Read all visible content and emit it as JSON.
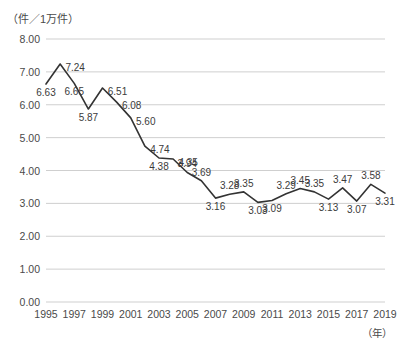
{
  "chart_data": {
    "type": "line",
    "title": "",
    "ylabel": "（件／1万件）",
    "xlabel": "（年）",
    "ylim": [
      0,
      8
    ],
    "yticks": [
      "0.00",
      "1.00",
      "2.00",
      "3.00",
      "4.00",
      "5.00",
      "6.00",
      "7.00",
      "8.00"
    ],
    "ytick_values": [
      0,
      1,
      2,
      3,
      4,
      5,
      6,
      7,
      8
    ],
    "grid": true,
    "legend": "none",
    "x": [
      1995,
      1996,
      1997,
      1998,
      1999,
      2000,
      2001,
      2002,
      2003,
      2004,
      2005,
      2006,
      2007,
      2008,
      2009,
      2010,
      2011,
      2012,
      2013,
      2014,
      2015,
      2016,
      2017,
      2018,
      2019
    ],
    "xtick_labels": [
      "1995",
      "1997",
      "1999",
      "2001",
      "2003",
      "2005",
      "2007",
      "2009",
      "2011",
      "2013",
      "2015",
      "2017",
      "2019"
    ],
    "xtick_values": [
      1995,
      1997,
      1999,
      2001,
      2003,
      2005,
      2007,
      2009,
      2011,
      2013,
      2015,
      2017,
      2019
    ],
    "values": [
      6.63,
      7.24,
      6.65,
      5.87,
      6.51,
      6.08,
      5.6,
      4.74,
      4.38,
      4.35,
      3.94,
      3.69,
      3.16,
      3.28,
      3.35,
      3.03,
      3.09,
      3.29,
      3.45,
      3.35,
      3.13,
      3.47,
      3.07,
      3.58,
      3.31
    ],
    "point_labels": [
      "6.63",
      "7.24",
      "6.65",
      "5.87",
      "6.51",
      "6.08",
      "5.60",
      "4.74",
      "4.38",
      "4.35",
      "3.94",
      "3.69",
      "3.16",
      "3.28",
      "3.35",
      "3.03",
      "3.09",
      "3.29",
      "3.45",
      "3.35",
      "3.13",
      "3.47",
      "3.07",
      "3.58",
      "3.31"
    ],
    "label_positions": [
      "below",
      "right",
      "below",
      "below",
      "right",
      "right",
      "right",
      "right",
      "below",
      "right",
      "above",
      "above",
      "below",
      "above",
      "above",
      "below",
      "below",
      "above",
      "above",
      "above",
      "below",
      "above",
      "below",
      "above",
      "below"
    ],
    "line_color": "#333333",
    "grid_color": "#cfcfcf"
  }
}
